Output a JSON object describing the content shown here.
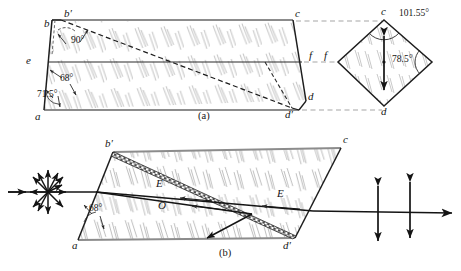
{
  "figure": {
    "panels": [
      {
        "id": "a",
        "label": "(a)"
      },
      {
        "id": "b",
        "label": "(b)"
      }
    ],
    "colors": {
      "outline": "#1a1a1a",
      "construction_dash": "#8a8a8a",
      "hatch": "#9a9a9a",
      "ray": "#141414",
      "balsam": "#3a3a3a",
      "background": "#ffffff",
      "edge_gray": "#8c8c8c"
    }
  },
  "panel_a": {
    "caption": "(a)",
    "vertices": [
      {
        "name": "b",
        "text": "b",
        "x": 44,
        "y": 18
      },
      {
        "name": "b-prime",
        "text": "b′",
        "x": 64,
        "y": 13
      },
      {
        "name": "c",
        "text": "c",
        "x": 296,
        "y": 13
      },
      {
        "name": "e",
        "text": "e",
        "x": 26,
        "y": 61
      },
      {
        "name": "f",
        "text": "f",
        "x": 299,
        "y": 56
      },
      {
        "name": "a",
        "text": "a",
        "x": 35,
        "y": 114
      },
      {
        "name": "d-prime",
        "text": "d′",
        "x": 259,
        "y": 111
      },
      {
        "name": "d",
        "text": "d",
        "x": 300,
        "y": 97
      }
    ],
    "angles": [
      {
        "name": "angle-90",
        "text": "90°",
        "x": 70,
        "y": 38
      },
      {
        "name": "angle-68",
        "text": "68°",
        "x": 52,
        "y": 79
      },
      {
        "name": "angle-71-5",
        "text": "71.5°",
        "x": 30,
        "y": 96
      }
    ]
  },
  "panel_a_endface": {
    "name": "rhomb-end-face",
    "vertices": [
      {
        "name": "c-end",
        "text": "c",
        "x": 385,
        "y": 12
      },
      {
        "name": "f-end",
        "text": "f",
        "x": 339,
        "y": 55
      },
      {
        "name": "d-end",
        "text": "d",
        "x": 386,
        "y": 110
      }
    ],
    "angles": [
      {
        "name": "angle-101-55",
        "text": "101.55°",
        "x": 405,
        "y": 16
      },
      {
        "name": "angle-78-5",
        "text": "78.5°",
        "x": 408,
        "y": 61
      }
    ],
    "optic_axis_arrow": "double-headed-vertical-arrow"
  },
  "panel_b": {
    "caption": "(b)",
    "vertices": [
      {
        "name": "b-prime",
        "text": "b′",
        "x": 107,
        "y": 145
      },
      {
        "name": "c",
        "text": "c",
        "x": 345,
        "y": 141
      },
      {
        "name": "a",
        "text": "a",
        "x": 72,
        "y": 238
      },
      {
        "name": "d-prime",
        "text": "d′",
        "x": 285,
        "y": 240
      }
    ],
    "angles": [
      {
        "name": "angle-68",
        "text": "68°",
        "x": 86,
        "y": 209
      }
    ],
    "rays": [
      {
        "name": "ray-label-E-left",
        "text": "E",
        "x": 152,
        "y": 186
      },
      {
        "name": "ray-label-O",
        "text": "O",
        "x": 154,
        "y": 206
      },
      {
        "name": "ray-label-E-right",
        "text": "E",
        "x": 272,
        "y": 194
      }
    ],
    "input_symbol": "unpolarized-starburst",
    "output_symbol": "vertical-double-arrow-polarization"
  }
}
